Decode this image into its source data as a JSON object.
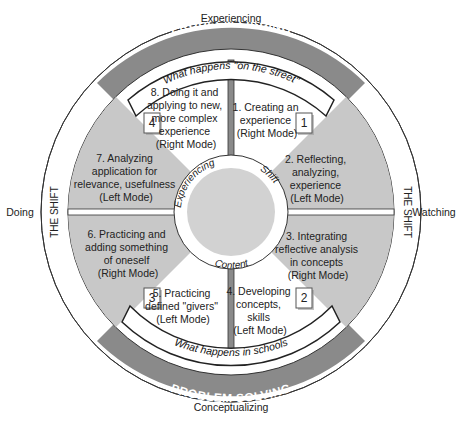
{
  "axes": {
    "top": "Experiencing",
    "bottom": "Conceptualizing",
    "left": "Doing",
    "right": "Watching"
  },
  "banners": {
    "top": "PROBLEM FINDING",
    "bottom": "PROBLEM SOLVING"
  },
  "ribbons": {
    "top": "What happens \"on the street\"",
    "bottom": "What happens in schools"
  },
  "side_labels": {
    "left": "THE SHIFT",
    "right": "THE SHIFT"
  },
  "center_ring": {
    "experiencing": "Experiencing",
    "shift": "Shift",
    "content": "Content"
  },
  "quadrant_boxes": [
    "1",
    "2",
    "3",
    "4"
  ],
  "steps": [
    {
      "lines": [
        "1. Creating an",
        "experience",
        "(Right Mode)"
      ]
    },
    {
      "lines": [
        "2. Reflecting,",
        "analyzing,",
        "experience",
        "(Left Mode)"
      ]
    },
    {
      "lines": [
        "3. Integrating",
        "reflective analysis",
        "in concepts",
        "(Right Mode)"
      ]
    },
    {
      "lines": [
        "4. Developing",
        "concepts,",
        "skills",
        "(Left Mode)"
      ]
    },
    {
      "lines": [
        "5. Practicing",
        "defined \"givers\"",
        "(Left Mode)"
      ]
    },
    {
      "lines": [
        "6. Practicing and",
        "adding something",
        "of oneself",
        "(Right Mode)"
      ]
    },
    {
      "lines": [
        "7. Analyzing",
        "application for",
        "relevance, usefulness",
        "(Left Mode)"
      ]
    },
    {
      "lines": [
        "8. Doing it and",
        "applying to new,",
        "more complex",
        "experience",
        "(Right Mode)"
      ]
    }
  ],
  "colors": {
    "dark_band": "#8a8a8a",
    "light_sector": "#c8c8c8",
    "center_disc": "#d2d2d2",
    "stroke": "#333333"
  }
}
